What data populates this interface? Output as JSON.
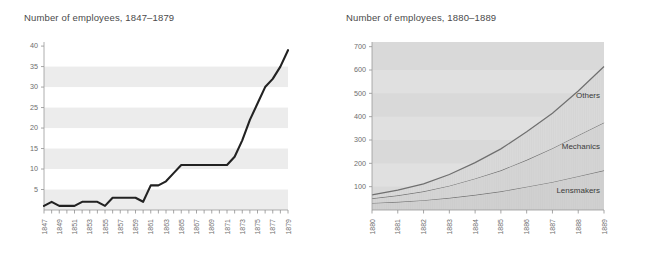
{
  "left": {
    "title": "Number of employees, 1847–1879",
    "yticks": [
      5,
      10,
      15,
      20,
      25,
      30,
      35,
      40
    ],
    "xticks": [
      "1847",
      "1849",
      "1851",
      "1853",
      "1855",
      "1857",
      "1859",
      "1861",
      "1863",
      "1865",
      "1867",
      "1869",
      "1871",
      "1873",
      "1875",
      "1877",
      "1879"
    ]
  },
  "right": {
    "title": "Number of employees, 1880–1889",
    "yticks": [
      100,
      200,
      300,
      400,
      500,
      600,
      700
    ],
    "xticks": [
      "1880",
      "1881",
      "1882",
      "1883",
      "1884",
      "1885",
      "1886",
      "1887",
      "1888",
      "1889"
    ],
    "labels": {
      "others": "Others",
      "mechanics": "Mechanics",
      "lensmakers": "Lensmakers"
    }
  },
  "colors": {
    "line": "#222222",
    "band": "#ececec",
    "area_fill": "#d2d2d2",
    "area_edge": "#6f6f6f",
    "text": "#4a4a4a",
    "axis": "#9a9a9a"
  },
  "chart_data": [
    {
      "type": "line",
      "title": "Number of employees, 1847–1879",
      "xlabel": "",
      "ylabel": "",
      "ylim": [
        0,
        41
      ],
      "grid": "horizontal-bands",
      "legend": "none",
      "x": [
        1847,
        1848,
        1849,
        1850,
        1851,
        1852,
        1853,
        1854,
        1855,
        1856,
        1857,
        1858,
        1859,
        1860,
        1861,
        1862,
        1863,
        1864,
        1865,
        1866,
        1867,
        1868,
        1869,
        1870,
        1871,
        1872,
        1873,
        1874,
        1875,
        1876,
        1877,
        1878,
        1879
      ],
      "values": [
        1,
        2,
        1,
        1,
        1,
        2,
        2,
        2,
        1,
        3,
        3,
        3,
        3,
        2,
        6,
        6,
        7,
        9,
        11,
        11,
        11,
        11,
        11,
        11,
        11,
        13,
        17,
        22,
        26,
        30,
        32,
        35,
        39
      ],
      "tick_labels_every": 2
    },
    {
      "type": "area",
      "title": "Number of employees, 1880–1889",
      "xlabel": "",
      "ylabel": "",
      "ylim": [
        0,
        720
      ],
      "grid": "horizontal-bands",
      "stacked": true,
      "legend": "inline-labels",
      "x": [
        1880,
        1881,
        1882,
        1883,
        1884,
        1885,
        1886,
        1887,
        1888,
        1889
      ],
      "categories": [
        "1880",
        "1881",
        "1882",
        "1883",
        "1884",
        "1885",
        "1886",
        "1887",
        "1888",
        "1889"
      ],
      "series": [
        {
          "name": "Lensmakers",
          "values": [
            30,
            35,
            42,
            52,
            65,
            80,
            100,
            120,
            145,
            170
          ]
        },
        {
          "name": "Mechanics",
          "values": [
            20,
            28,
            38,
            52,
            70,
            90,
            115,
            145,
            175,
            205
          ]
        },
        {
          "name": "Others",
          "values": [
            15,
            22,
            32,
            48,
            68,
            92,
            120,
            150,
            190,
            240
          ]
        }
      ],
      "cumulative_totals": [
        65,
        85,
        112,
        152,
        203,
        262,
        335,
        415,
        510,
        615
      ]
    }
  ]
}
